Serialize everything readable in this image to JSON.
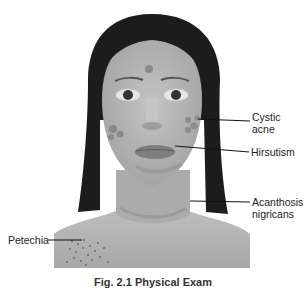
{
  "figure": {
    "caption": "Fig. 2.1 Physical Exam",
    "labels": [
      {
        "id": "cystic-acne",
        "lines": [
          "Cystic",
          "acne"
        ]
      },
      {
        "id": "hirsutism",
        "lines": [
          "Hirsutism"
        ]
      },
      {
        "id": "acanthosis-nigricans",
        "lines": [
          "Acanthosis",
          "nigricans"
        ]
      },
      {
        "id": "petechia",
        "lines": [
          "Petechia"
        ]
      }
    ]
  },
  "colors": {
    "skin": "#b4b4b4",
    "hair": "#1c1c1c",
    "lips": "#7e7e7e",
    "lesions": "#8a8a8a",
    "leader_lines": "#111111",
    "text": "#222222"
  }
}
